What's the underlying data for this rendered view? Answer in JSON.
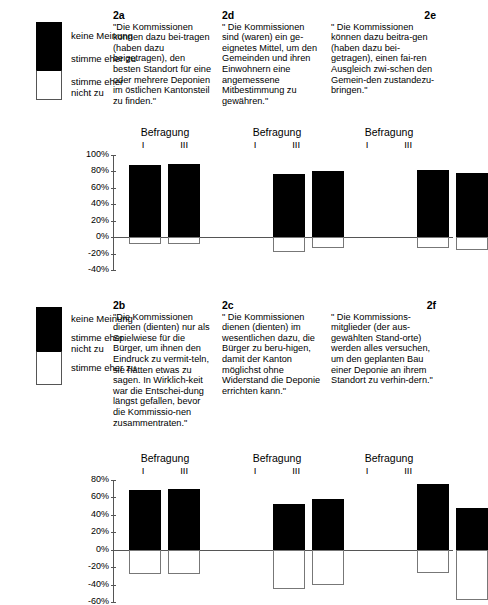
{
  "chart_data": [
    {
      "type": "bar",
      "id": "upper",
      "title": "",
      "xlabel": "",
      "ylabel": "",
      "ylim": [
        -40,
        100
      ],
      "ytick_labels": [
        "100%",
        "80%",
        "60%",
        "40%",
        "20%",
        "0%",
        "-20%",
        "-40%"
      ],
      "ytick_values": [
        100,
        80,
        60,
        40,
        20,
        0,
        -20,
        -40
      ],
      "grid": false,
      "legend_position": "top-left",
      "legend": [
        {
          "label": "keine Meinung",
          "color": "#000000"
        },
        {
          "label": "stimme eher zu",
          "color": "#000000"
        },
        {
          "label": "stimme eher nicht zu",
          "color": "#ffffff"
        }
      ],
      "group_header": "Befragung",
      "categories": [
        "I",
        "III"
      ],
      "groups": [
        {
          "code": "2a",
          "code_align": "left",
          "question": "\"Die Kommissionen können dazu bei-tragen (haben dazu beigetragen), den besten Standort für eine oder mehrere Deponien im östlichen Kantonsteil zu finden.\"",
          "values_positive": [
            88,
            89
          ],
          "values_negative": [
            -8,
            -8
          ]
        },
        {
          "code": "2d",
          "code_align": "left",
          "question": "\" Die Kommissionen sind (waren) ein ge-eignetes Mittel, um den Gemeinden und ihren Einwohnern eine angemessene Mitbestimmung zu gewähren.\"",
          "values_positive": [
            77,
            81
          ],
          "values_negative": [
            -18,
            -13
          ]
        },
        {
          "code": "2e",
          "code_align": "right",
          "question": "\" Die Kommissionen können dazu beitra-gen (haben dazu bei-getragen), einen fai-ren Ausgleich zwi-schen den Gemein-den zustandezu-bringen.\"",
          "values_positive": [
            82,
            78
          ],
          "values_negative": [
            -13,
            -16
          ]
        }
      ]
    },
    {
      "type": "bar",
      "id": "lower",
      "title": "",
      "xlabel": "",
      "ylabel": "",
      "ylim": [
        -60,
        80
      ],
      "ytick_labels": [
        "80%",
        "60%",
        "40%",
        "20%",
        "0%",
        "-20%",
        "-40%",
        "-60%"
      ],
      "ytick_values": [
        80,
        60,
        40,
        20,
        0,
        -20,
        -40,
        -60
      ],
      "grid": false,
      "legend_position": "top-left",
      "legend": [
        {
          "label": "keine Meinung",
          "color": "#000000"
        },
        {
          "label": "stimme eher nicht zu",
          "color": "#000000"
        },
        {
          "label": "stimme eher zu",
          "color": "#ffffff"
        }
      ],
      "group_header": "Befragung",
      "categories": [
        "I",
        "III"
      ],
      "groups": [
        {
          "code": "2b",
          "code_align": "left",
          "question": "\"Die Kommissionen dienen (dienten) nur als Spielwiese für die Bürger, um ihnen den Eindruck zu vermit-teln, sie hätten etwas zu sagen. In Wirklich-keit war die Entschei-dung längst gefallen, bevor die Kommissio-nen zusammentraten.\"",
          "values_positive": [
            68,
            70
          ],
          "values_negative": [
            -28,
            -28
          ]
        },
        {
          "code": "2c",
          "code_align": "left",
          "question": "\" Die Kommissionen dienen (dienten) im wesentlichen dazu, die Bürger zu beru-higen, damit der Kanton möglichst ohne Widerstand die Deponie errichten kann.\"",
          "values_positive": [
            52,
            58
          ],
          "values_negative": [
            -45,
            -40
          ]
        },
        {
          "code": "2f",
          "code_align": "right",
          "question": "\" Die Kommissions-mitglieder (der aus-gewählten Stand-orte) werden alles versuchen, um den geplanten Bau einer Deponie an ihrem Standort zu verhin-dern.\"",
          "values_positive": [
            75,
            48
          ],
          "values_negative": [
            -27,
            -58
          ]
        }
      ]
    }
  ],
  "upper": {
    "legend": {
      "item1": "keine Meinung",
      "item2": "stimme eher zu",
      "item3_line1": "stimme eher",
      "item3_line2": "nicht zu"
    },
    "q1": {
      "code": "2a",
      "text": "\"Die Kommissionen können dazu bei-tragen (haben dazu beigetragen), den besten Standort für eine oder mehrere Deponien im östlichen Kantonsteil zu finden.\""
    },
    "q2": {
      "code": "2d",
      "text": "\" Die Kommissionen sind (waren) ein ge-eignetes Mittel, um den Gemeinden und ihren Einwohnern eine angemessene Mitbestimmung zu gewähren.\""
    },
    "q3": {
      "code": "2e",
      "text": "\" Die Kommissionen können dazu beitra-gen (haben dazu bei-getragen), einen fai-ren Ausgleich zwi-schen den Gemein-den zustandezu-bringen.\""
    },
    "group_header": "Befragung",
    "wave1": "I",
    "wave2": "III",
    "ticks": [
      "100%",
      "80%",
      "60%",
      "40%",
      "20%",
      "0%",
      "-20%",
      "-40%"
    ]
  },
  "lower": {
    "legend": {
      "item1": "keine Meinung",
      "item2_line1": "stimme eher",
      "item2_line2": "nicht zu",
      "item3": "stimme eher zu"
    },
    "q1": {
      "code": "2b",
      "text": "\"Die Kommissionen dienen (dienten) nur als Spielwiese für die Bürger, um ihnen den Eindruck zu vermit-teln, sie hätten etwas zu sagen. In Wirklich-keit war die Entschei-dung längst gefallen, bevor die Kommissio-nen zusammentraten.\""
    },
    "q2": {
      "code": "2c",
      "text": "\" Die Kommissionen dienen (dienten) im wesentlichen dazu, die Bürger zu beru-higen, damit der Kanton möglichst ohne Widerstand die Deponie errichten kann.\""
    },
    "q3": {
      "code": "2f",
      "text": "\" Die Kommissions-mitglieder (der aus-gewählten Stand-orte) werden alles versuchen, um den geplanten Bau einer Deponie an ihrem Standort zu verhin-dern.\""
    },
    "group_header": "Befragung",
    "wave1": "I",
    "wave2": "III",
    "ticks": [
      "80%",
      "60%",
      "40%",
      "20%",
      "0%",
      "-20%",
      "-40%",
      "-60%"
    ]
  }
}
